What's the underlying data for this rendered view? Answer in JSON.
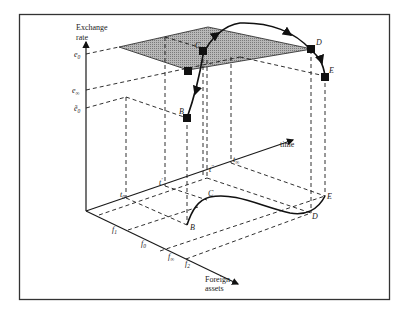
{
  "diagram": {
    "type": "3d-phase-diagram",
    "axes": {
      "vertical": {
        "label_line1": "Exchange",
        "label_line2": "rate"
      },
      "depth": {
        "label": "time"
      },
      "horizontal": {
        "label_line1": "Foreign",
        "label_line2": "assets"
      }
    },
    "exchange_rate_ticks": [
      {
        "symbol": "e",
        "subscript": "0",
        "accent": ""
      },
      {
        "symbol": "e",
        "subscript": "∞",
        "accent": ""
      },
      {
        "symbol": "ẽ",
        "subscript": "0",
        "accent": "tilde"
      }
    ],
    "time_ticks": [
      {
        "symbol": "t",
        "subscript": "0"
      },
      {
        "symbol": "t",
        "subscript": "′"
      },
      {
        "symbol": "t",
        "subscript": "′′"
      },
      {
        "symbol": "t",
        "subscript": "∞"
      }
    ],
    "foreign_asset_ticks": [
      {
        "symbol": "f",
        "subscript": "1"
      },
      {
        "symbol": "f",
        "subscript": "0"
      },
      {
        "symbol": "f",
        "subscript": "∞"
      },
      {
        "symbol": "f",
        "subscript": "2"
      }
    ],
    "points_upper": [
      "B",
      "C",
      "D",
      "E"
    ],
    "points_lower": [
      "B",
      "C",
      "D",
      "E"
    ],
    "colors": {
      "frame": "#333333",
      "ink": "#1a1a1a",
      "plane_fill": "#9a9a9a"
    }
  }
}
